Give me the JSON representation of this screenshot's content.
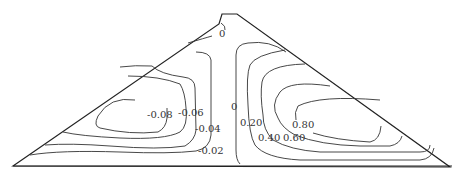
{
  "diagram": {
    "type": "contour-plot",
    "labels": {
      "crest_zero": "0",
      "center_zero": "0",
      "neg_008": "-0.08",
      "neg_006": "-0.06",
      "neg_004": "-0.04",
      "neg_002": "-0.02",
      "pos_020": "0.20",
      "pos_040": "0.40",
      "pos_060": "0.60",
      "pos_080": "0.80"
    },
    "left_contour_levels": [
      "-0.02",
      "-0.04",
      "-0.06",
      "-0.08"
    ],
    "right_contour_levels": [
      "0.20",
      "0.40",
      "0.60",
      "0.80"
    ],
    "colors": {
      "line": "#333333",
      "background": "#ffffff"
    }
  }
}
